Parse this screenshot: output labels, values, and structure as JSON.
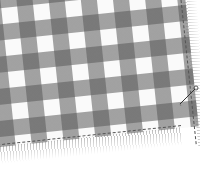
{
  "image": {
    "subject": "gingham checkered fabric with frayed fringe edges and a sewing needle",
    "colors": {
      "dark_check": "#5a5a5a",
      "mid_check": "#a8a8a8",
      "light_check": "#f4f4f4",
      "background": "#ffffff"
    }
  }
}
